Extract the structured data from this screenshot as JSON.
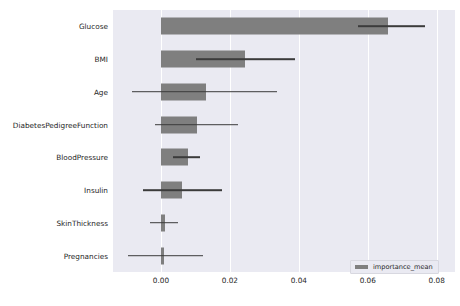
{
  "chart_data": {
    "type": "bar",
    "orientation": "horizontal",
    "title": "",
    "xlabel": "",
    "ylabel": "",
    "xlim": [
      -0.0139,
      0.0853
    ],
    "xticks": [
      0.0,
      0.02,
      0.04,
      0.06,
      0.08
    ],
    "xticklabels": [
      "0.00",
      "0.02",
      "0.04",
      "0.06",
      "0.08"
    ],
    "grid": true,
    "grid_axis": "x",
    "legend": {
      "position": "lower right",
      "entries": [
        {
          "label": "importance_mean",
          "color": "#7f7f7f"
        }
      ]
    },
    "categories": [
      "Glucose",
      "BMI",
      "Age",
      "DiabetesPedigreeFunction",
      "BloodPressure",
      "Insulin",
      "SkinThickness",
      "Pregnancies"
    ],
    "series": [
      {
        "name": "importance_mean",
        "color": "#7f7f7f",
        "values": [
          0.0658,
          0.0245,
          0.013,
          0.0104,
          0.0078,
          0.0061,
          0.0013,
          0.001
        ]
      }
    ],
    "error_bars": {
      "color": "#3b3b3b",
      "low": [
        0.0571,
        0.0101,
        -0.0084,
        -0.0017,
        0.0035,
        -0.0052,
        -0.0032,
        -0.0095
      ],
      "high": [
        0.0765,
        0.0388,
        0.0336,
        0.0223,
        0.0113,
        0.0177,
        0.0049,
        0.0122
      ]
    },
    "colors": {
      "axes_background": "#eaeaf2",
      "figure_background": "#ffffff",
      "gridline": "#ffffff",
      "bar": "#7f7f7f",
      "error": "#3b3b3b",
      "tick_label": "#262626"
    }
  }
}
